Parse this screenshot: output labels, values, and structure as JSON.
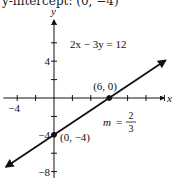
{
  "caption": "y-intercept: (0, −4)",
  "chart_data": {
    "type": "line",
    "title": "",
    "equation": "2x − 3y = 12",
    "slope_label": "m",
    "slope_num": "2",
    "slope_den": "3",
    "xlabel": "x",
    "ylabel": "y",
    "xlim": [
      -5.5,
      12
    ],
    "ylim": [
      -8.5,
      9
    ],
    "x_tick_step": 2,
    "y_tick_step": 2,
    "x_tick_labels": [
      {
        "value": -4,
        "label": "−4"
      }
    ],
    "y_tick_labels": [
      {
        "value": 4,
        "label": "4"
      },
      {
        "value": -4,
        "label": "−4"
      },
      {
        "value": -8,
        "label": "−8"
      }
    ],
    "line": {
      "slope": 0.6667,
      "intercept": -4,
      "x_start": -5.2,
      "x_end": 12.1
    },
    "points": [
      {
        "x": 6,
        "y": 0,
        "label": "(6, 0)"
      },
      {
        "x": 0,
        "y": -4,
        "label": "(0, −4)"
      }
    ],
    "grid": false,
    "legend": null
  }
}
